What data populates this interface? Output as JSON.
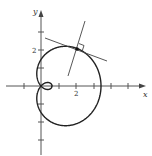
{
  "figure": {
    "axes": {
      "x_label": "x",
      "y_label": "y",
      "x_tick_label": "2",
      "y_tick_label": "2"
    },
    "curve": {
      "type": "limacon-inner-loop",
      "stroke": "#222222"
    },
    "annotations": {
      "tangent_line": "line tangent to curve at point near (2, 2)",
      "normal_line": "line perpendicular to tangent at the same point",
      "right_angle_marker": "square marker indicating perpendicularity",
      "point": "marked point of tangency"
    },
    "colors": {
      "axis": "#555555",
      "curve": "#222222",
      "lines": "#444444"
    }
  }
}
